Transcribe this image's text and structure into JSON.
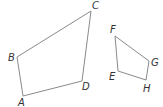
{
  "diagram": {
    "shapes": [
      {
        "name": "quadrilateral-ABCD",
        "vertices": [
          {
            "label": "A",
            "x": 23,
            "y": 96,
            "lx": 18,
            "ly": 106
          },
          {
            "label": "B",
            "x": 17,
            "y": 57,
            "lx": 8,
            "ly": 61
          },
          {
            "label": "C",
            "x": 91,
            "y": 11,
            "lx": 92,
            "ly": 9
          },
          {
            "label": "D",
            "x": 82,
            "y": 81,
            "lx": 82,
            "ly": 90
          }
        ]
      },
      {
        "name": "quadrilateral-EFGH",
        "vertices": [
          {
            "label": "E",
            "x": 118,
            "y": 71,
            "lx": 109,
            "ly": 80
          },
          {
            "label": "F",
            "x": 115,
            "y": 36,
            "lx": 110,
            "ly": 33
          },
          {
            "label": "G",
            "x": 149,
            "y": 61,
            "lx": 151,
            "ly": 66
          },
          {
            "label": "H",
            "x": 146,
            "y": 80,
            "lx": 143,
            "ly": 92
          }
        ]
      }
    ],
    "labels": {
      "A": "A",
      "B": "B",
      "C": "C",
      "D": "D",
      "E": "E",
      "F": "F",
      "G": "G",
      "H": "H"
    },
    "colors": {
      "edge": "#8a8a8a",
      "label": "#333333"
    }
  }
}
